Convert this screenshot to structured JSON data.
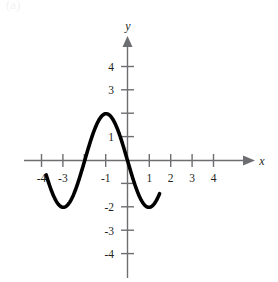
{
  "figure": {
    "label": "(a)",
    "axes": {
      "x_axis_name": "x",
      "y_axis_name": "y",
      "x_tick_labels": [
        "-4",
        "-3",
        "-1",
        "1",
        "2",
        "3",
        "4"
      ],
      "y_tick_labels": [
        "4",
        "3",
        "1",
        "-2",
        "-3",
        "-4"
      ]
    },
    "colors": {
      "curve": "#000000",
      "axis": "#6d6e71",
      "text": "#231f20",
      "background": "#ffffff"
    }
  },
  "chart_data": {
    "type": "line",
    "title": "",
    "xlabel": "x",
    "ylabel": "y",
    "xlim": [
      -4.6,
      4.6
    ],
    "ylim": [
      -4.6,
      4.6
    ],
    "grid": false,
    "legend": null,
    "xticks": [
      -4,
      -3,
      -2,
      -1,
      1,
      2,
      3,
      4
    ],
    "xtick_labels": [
      "-4",
      "-3",
      "",
      "-1",
      "1",
      "2",
      "3",
      "4"
    ],
    "yticks": [
      4,
      3,
      2,
      1,
      -1,
      -2,
      -3,
      -4
    ],
    "ytick_labels": [
      "4",
      "3",
      "",
      "1",
      "",
      "-2",
      "-3",
      "-4"
    ],
    "series": [
      {
        "name": "cosine curve",
        "equation": "y = 2*cos(pi*(x+1)/2)",
        "domain": [
          -3.8,
          1.5
        ],
        "amplitude": 2,
        "period": 4,
        "x": [
          -3.8,
          -3.6,
          -3.4,
          -3.2,
          -3.0,
          -2.8,
          -2.6,
          -2.4,
          -2.2,
          -2.0,
          -1.8,
          -1.6,
          -1.4,
          -1.2,
          -1.0,
          -0.8,
          -0.6,
          -0.4,
          -0.2,
          0.0,
          0.2,
          0.4,
          0.6,
          0.8,
          1.0,
          1.2,
          1.4,
          1.5
        ],
        "y": [
          -1.8,
          -1.95,
          -2.0,
          -1.95,
          -1.8,
          -1.54,
          -1.18,
          -0.73,
          -0.25,
          0.0,
          0.62,
          1.18,
          1.62,
          1.9,
          2.0,
          1.9,
          1.62,
          1.18,
          0.62,
          0.0,
          -0.62,
          -1.18,
          -1.62,
          -1.9,
          -2.0,
          -1.9,
          -1.62,
          -1.41
        ],
        "key_points": {
          "maxima": [
            {
              "x": -1,
              "y": 2
            }
          ],
          "minima": [
            {
              "x": -3,
              "y": -2
            },
            {
              "x": 1,
              "y": -2
            }
          ],
          "zeros": [
            -2,
            0
          ]
        }
      }
    ]
  }
}
